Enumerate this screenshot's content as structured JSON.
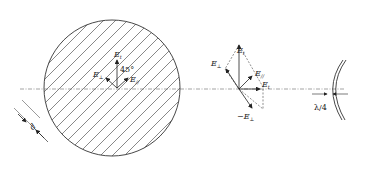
{
  "diagram": {
    "type": "optics-polarization-diagram",
    "left_disc": {
      "field_labels": {
        "e_vertical": "E",
        "e_vertical_sub": "t",
        "e_left": "E",
        "e_left_sub": "⊥",
        "e_right": "E",
        "e_right_sub": "//"
      },
      "angle_label": "45°",
      "grating_period_label": "d"
    },
    "vector_diagram": {
      "labels": {
        "e_top": "E",
        "e_top_sub": "t",
        "e_perp": "E",
        "e_perp_sub": "⊥",
        "e_par": "E",
        "e_par_sub": "//",
        "e_out": "E",
        "e_out_sub": "t",
        "e_neg_perp": "−E",
        "e_neg_perp_sub": "⊥"
      }
    },
    "wavefront": {
      "shift_label": "λ/4"
    },
    "colors": {
      "line": "#333333",
      "hatch": "#555555",
      "axis": "#666666",
      "background": "#ffffff"
    }
  }
}
